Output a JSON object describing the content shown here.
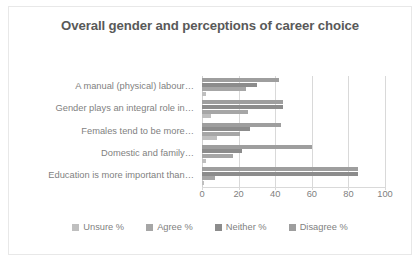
{
  "chart_data": {
    "type": "bar",
    "orientation": "horizontal",
    "title": "Overall gender and perceptions of career choice",
    "xlabel": "",
    "ylabel": "",
    "xlim": [
      0,
      100
    ],
    "xticks": [
      0,
      20,
      40,
      60,
      80,
      100
    ],
    "grid": true,
    "legend_position": "bottom",
    "categories": [
      "A manual (physical) labour…",
      "Gender plays an integral role in…",
      "Females tend to be more…",
      "Domestic and family…",
      "Education is more important than…"
    ],
    "series": [
      {
        "name": "Unsure %",
        "color": "#bfbfbf",
        "values": [
          2,
          5,
          8,
          2,
          1
        ]
      },
      {
        "name": "Agree %",
        "color": "#a6a6a6",
        "values": [
          24,
          25,
          21,
          17,
          7
        ]
      },
      {
        "name": "Neither %",
        "color": "#8c8c8c",
        "values": [
          30,
          44,
          26,
          22,
          85
        ]
      },
      {
        "name": "Disagree %",
        "color": "#9e9e9e",
        "values": [
          42,
          44,
          43,
          60,
          85
        ]
      }
    ]
  },
  "legend": {
    "items": [
      {
        "label": "Unsure %",
        "color": "#bfbfbf"
      },
      {
        "label": "Agree %",
        "color": "#a6a6a6"
      },
      {
        "label": "Neither %",
        "color": "#8c8c8c"
      },
      {
        "label": "Disagree %",
        "color": "#9e9e9e"
      }
    ]
  }
}
